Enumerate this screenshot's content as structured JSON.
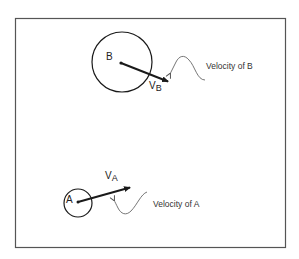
{
  "diagram": {
    "title": "",
    "frame": {
      "x": 15,
      "y": 18,
      "width": 270,
      "height": 229,
      "stroke": "#555555"
    },
    "objects": [
      {
        "id": "B",
        "label": "B",
        "circle": {
          "cx": 122,
          "cy": 62,
          "r": 30
        },
        "center_dot": {
          "x": 121,
          "y": 63
        },
        "velocity": {
          "symbol": "V",
          "subscript": "B",
          "from": [
            121,
            63
          ],
          "to": [
            169,
            82
          ]
        },
        "annotation": {
          "text": "Velocity of B"
        }
      },
      {
        "id": "A",
        "label": "A",
        "circle": {
          "cx": 78,
          "cy": 203,
          "r": 14
        },
        "center_dot": {
          "x": 78,
          "y": 202
        },
        "velocity": {
          "symbol": "V",
          "subscript": "A",
          "from": [
            78,
            202
          ],
          "to": [
            131,
            187
          ]
        },
        "annotation": {
          "text": "Velocity of A"
        }
      }
    ],
    "colors": {
      "ink": "#1a1a1a",
      "leader": "#666666",
      "background": "#ffffff"
    }
  }
}
